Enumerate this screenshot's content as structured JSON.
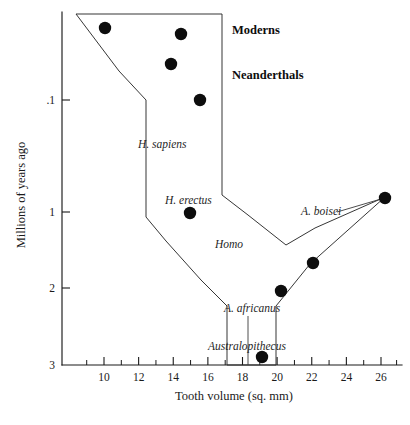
{
  "chart_data": {
    "type": "scatter",
    "title": "",
    "xlabel": "Tooth volume (sq. mm)",
    "ylabel": "Millions of years ago",
    "xlim": [
      8.6,
      27.2
    ],
    "ylim_note": "Non-linear (log-like) time axis, inverted: older at bottom",
    "grid": false,
    "legend": false,
    "x_ticks_major": [
      "10",
      "12",
      "14",
      "16",
      "18",
      "20",
      "22",
      "24",
      "26"
    ],
    "x_ticks_major_values": [
      10,
      12,
      14,
      16,
      18,
      20,
      22,
      24,
      26
    ],
    "x_ticks_minor_values": [
      9,
      11,
      13,
      15,
      17,
      19,
      21,
      23,
      25,
      26.9
    ],
    "y_ticks": [
      ".1",
      "1",
      "2",
      "3"
    ],
    "y_tick_values": [
      0.1,
      1,
      2,
      3
    ],
    "y_tick_pixels": [
      100,
      212,
      288,
      365
    ],
    "points": [
      {
        "id": "p1",
        "group": "Moderns",
        "tooth_volume": 10.9,
        "millions_years_ago": 0.02,
        "px": 105,
        "py": 28
      },
      {
        "id": "p2",
        "group": "Moderns",
        "tooth_volume": 15.7,
        "millions_years_ago": 0.03,
        "px": 181,
        "py": 34
      },
      {
        "id": "p3",
        "group": "Neanderthals",
        "tooth_volume": 15.0,
        "millions_years_ago": 0.05,
        "px": 171,
        "py": 64
      },
      {
        "id": "p4",
        "group": "Neanderthals",
        "tooth_volume": 16.2,
        "millions_years_ago": 0.1,
        "px": 200,
        "py": 100
      },
      {
        "id": "p5",
        "group": "H. erectus",
        "tooth_volume": 15.9,
        "millions_years_ago": 1.0,
        "px": 190,
        "py": 213
      },
      {
        "id": "p6",
        "group": "A. boisei",
        "tooth_volume": 26.5,
        "millions_years_ago": 0.9,
        "px": 385,
        "py": 198
      },
      {
        "id": "p7",
        "group": "A. boisei",
        "tooth_volume": 22.3,
        "millions_years_ago": 1.6,
        "px": 313,
        "py": 263
      },
      {
        "id": "p8",
        "group": "A. africanus",
        "tooth_volume": 20.7,
        "millions_years_ago": 2.0,
        "px": 281,
        "py": 291
      },
      {
        "id": "p9",
        "group": "Australopithecus",
        "tooth_volume": 19.8,
        "millions_years_ago": 2.9,
        "px": 262,
        "py": 357
      }
    ],
    "envelope_outline": {
      "description": "Hand-drawn range envelope enclosing the hominid lineages",
      "points_px": "76,14 222,14 222,195 248,215 286,245 315,228 385,197 310,264 276,306 276,365 227,365 227,306 201,280 166,241 146,217 146,194 146,100 119,71 76,14"
    },
    "annotations": [
      {
        "name": "moderns",
        "text": "Moderns",
        "style": "bold",
        "px": 232,
        "py": 34
      },
      {
        "name": "neanderthals",
        "text": "Neanderthals",
        "style": "bold",
        "px": 232,
        "py": 79
      },
      {
        "name": "h-sapiens",
        "text": "H. sapiens",
        "style": "italic",
        "px": 138,
        "py": 148
      },
      {
        "name": "h-erectus",
        "text": "H. erectus",
        "style": "italic",
        "px": 165,
        "py": 204
      },
      {
        "name": "a-boisei",
        "text": "A. boisei",
        "style": "italic",
        "px": 301,
        "py": 215
      },
      {
        "name": "homo",
        "text": "Homo",
        "style": "italic",
        "px": 215,
        "py": 248
      },
      {
        "name": "a-africanus",
        "text": "A. africanus",
        "style": "italic",
        "px": 224,
        "py": 312
      },
      {
        "name": "australopithecus",
        "text": "Australopithecus",
        "style": "italic",
        "px": 208,
        "py": 350
      }
    ]
  }
}
